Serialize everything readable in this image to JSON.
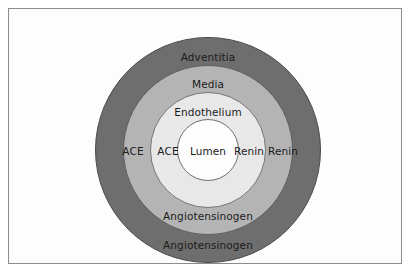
{
  "figure": {
    "layers": [
      {
        "id": "adventitia",
        "label": "Adventitia",
        "color": "#6e6e6e"
      },
      {
        "id": "media",
        "label": "Media",
        "color": "#b4b4b4"
      },
      {
        "id": "endothelium",
        "label": "Endothelium",
        "color": "#e8e8e8"
      },
      {
        "id": "lumen",
        "label": "Lumen",
        "color": "#fdfdfd"
      }
    ],
    "labels": {
      "adventitia": "Adventitia",
      "media": "Media",
      "endothelium": "Endothelium",
      "lumen": "Lumen",
      "ace_media": "ACE",
      "ace_endothelium": "ACE",
      "renin_endothelium": "Renin",
      "renin_media": "Renin",
      "angiotensinogen_media": "Angiotensinogen",
      "angiotensinogen_adventitia": "Angiotensinogen"
    },
    "colors": {
      "frame_border": "#8c8c8c",
      "background": "#ffffff",
      "text": "#1b1b1b",
      "ring_outline": "#5a5a5a"
    }
  }
}
